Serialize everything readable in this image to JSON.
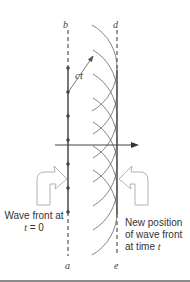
{
  "figure": {
    "labels": {
      "top_left": "b",
      "top_right": "d",
      "bottom_left": "a",
      "bottom_right": "e",
      "radius": "ct"
    },
    "caption_left": {
      "line1": "Wave front at",
      "line2_var": "t",
      "line2_rest": " = 0"
    },
    "caption_right": {
      "line1": "New position",
      "line2": "of wave front",
      "line3_pre": "at time ",
      "line3_var": "t"
    },
    "colors": {
      "line": "#555555",
      "wavelet": "#777777",
      "hollow_arrow": "#aaaaaa",
      "text": "#333333"
    },
    "geometry": {
      "initial_front_x": 68,
      "new_front_x": 117,
      "wavelet_radius": 49,
      "source_points_y": [
        68,
        92,
        116,
        140,
        164,
        188,
        212
      ],
      "propagation_arrow_y": 145
    }
  }
}
